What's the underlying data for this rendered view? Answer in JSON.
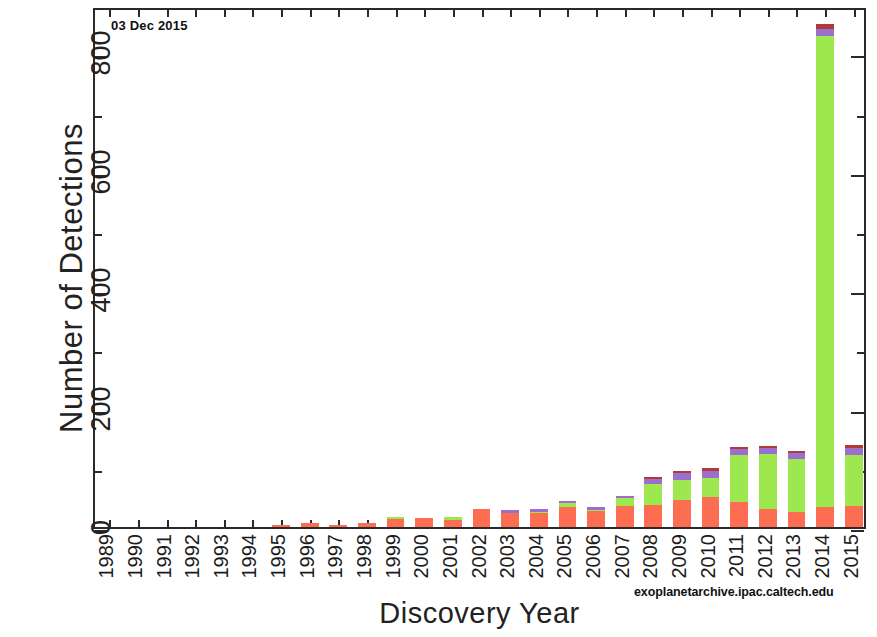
{
  "chart_data": {
    "type": "bar",
    "subtype": "stacked-bar",
    "title": "",
    "datestamp": "03 Dec 2015",
    "xlabel": "Discovery Year",
    "ylabel": "Number of Detections",
    "credit": "exoplanetarchive.ipac.caltech.edu",
    "ylim": [
      0,
      880
    ],
    "ytick_labels": [
      "0",
      "200",
      "400",
      "600",
      "800"
    ],
    "ytick_values": [
      0,
      200,
      400,
      600,
      800
    ],
    "yminor_values": [
      100,
      300,
      500,
      700
    ],
    "grid": false,
    "legend_position": "none",
    "categories": [
      "1989",
      "1990",
      "1991",
      "1992",
      "1993",
      "1994",
      "1995",
      "1996",
      "1997",
      "1998",
      "1999",
      "2000",
      "2001",
      "2002",
      "2003",
      "2004",
      "2005",
      "2006",
      "2007",
      "2008",
      "2009",
      "2010",
      "2011",
      "2012",
      "2013",
      "2014",
      "2015"
    ],
    "series": [
      {
        "name": "Radial Velocity",
        "color": "#fc6d52",
        "values": [
          0,
          0,
          0,
          0,
          0,
          0,
          1,
          6,
          1,
          6,
          13,
          16,
          12,
          31,
          24,
          24,
          33,
          27,
          36,
          38,
          45,
          50,
          43,
          30,
          26,
          34,
          36
        ]
      },
      {
        "name": "Transit",
        "color": "#9ee84f",
        "values": [
          0,
          0,
          0,
          0,
          0,
          0,
          0,
          0,
          0,
          0,
          1,
          0,
          1,
          0,
          0,
          2,
          7,
          2,
          13,
          35,
          35,
          33,
          78,
          93,
          89,
          795,
          86
        ]
      },
      {
        "name": "Microlensing / Imaging",
        "color": "#9c6ecd",
        "values": [
          0,
          0,
          0,
          0,
          0,
          0,
          0,
          0,
          0,
          0,
          0,
          0,
          0,
          0,
          1,
          3,
          4,
          4,
          4,
          8,
          11,
          12,
          10,
          10,
          10,
          13,
          12
        ]
      },
      {
        "name": "Other",
        "color": "#b03a3a",
        "values": [
          0,
          0,
          0,
          0,
          0,
          0,
          0,
          0,
          0,
          0,
          0,
          0,
          0,
          0,
          0,
          0,
          0,
          0,
          0,
          1,
          2,
          2,
          3,
          1,
          1,
          8,
          2
        ]
      }
    ],
    "totals": [
      0,
      0,
      0,
      0,
      0,
      0,
      1,
      6,
      1,
      6,
      14,
      16,
      13,
      31,
      25,
      29,
      44,
      33,
      53,
      82,
      93,
      97,
      134,
      134,
      126,
      850,
      136
    ]
  }
}
